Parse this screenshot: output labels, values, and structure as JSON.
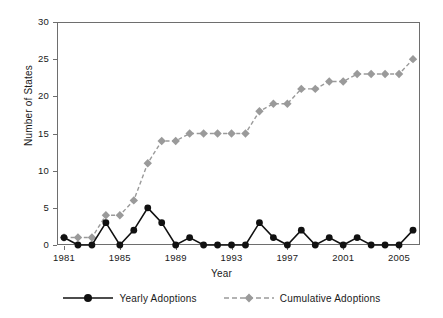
{
  "chart_data": {
    "type": "line",
    "title": "",
    "xlabel": "Year",
    "ylabel": "Number of States",
    "xlim": [
      1981,
      2006
    ],
    "ylim": [
      0,
      30
    ],
    "yticks": [
      0,
      5,
      10,
      15,
      20,
      25,
      30
    ],
    "xticks": [
      1981,
      1985,
      1989,
      1993,
      1997,
      2001,
      2005
    ],
    "grid": false,
    "legend_position": "bottom",
    "x": [
      1981,
      1982,
      1983,
      1984,
      1985,
      1986,
      1987,
      1988,
      1989,
      1990,
      1991,
      1992,
      1993,
      1994,
      1995,
      1996,
      1997,
      1998,
      1999,
      2000,
      2001,
      2002,
      2003,
      2004,
      2005,
      2006
    ],
    "series": [
      {
        "name": "Yearly Adoptions",
        "color": "#111111",
        "marker": "circle",
        "linestyle": "solid",
        "values": [
          1,
          0,
          0,
          3,
          0,
          2,
          5,
          3,
          0,
          1,
          0,
          0,
          0,
          0,
          3,
          1,
          0,
          2,
          0,
          1,
          0,
          1,
          0,
          0,
          0,
          2
        ]
      },
      {
        "name": "Cumulative Adoptions",
        "color": "#9a9a9a",
        "marker": "diamond",
        "linestyle": "dashed",
        "values": [
          1,
          1,
          1,
          4,
          4,
          6,
          11,
          14,
          14,
          15,
          15,
          15,
          15,
          15,
          18,
          19,
          19,
          21,
          21,
          22,
          22,
          23,
          23,
          23,
          23,
          25
        ]
      }
    ]
  },
  "axes": {
    "ytick_labels": [
      "0",
      "5",
      "10",
      "15",
      "20",
      "25",
      "30"
    ],
    "xtick_labels": [
      "1981",
      "1985",
      "1989",
      "1993",
      "1997",
      "2001",
      "2005"
    ],
    "y_axis_title": "Number of States",
    "x_axis_title": "Year"
  },
  "legend": {
    "items": [
      {
        "label": "Yearly Adoptions"
      },
      {
        "label": "Cumulative Adoptions"
      }
    ]
  }
}
